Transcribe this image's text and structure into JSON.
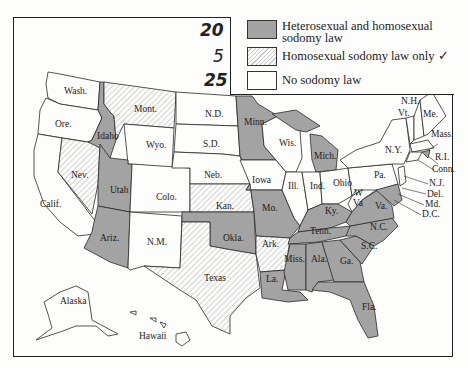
{
  "legend": {
    "items": [
      {
        "count": "20",
        "label_line1": "Heterosexual and homosexual",
        "label_line2": "sodomy law",
        "fill": "gray"
      },
      {
        "count": "5",
        "label_line1": "Homosexual sodomy law only ✓",
        "label_line2": "",
        "fill": "hatched"
      },
      {
        "count": "25",
        "label_line1": "No sodomy law",
        "label_line2": "",
        "fill": "white"
      }
    ]
  },
  "colors": {
    "gray": "#a3a3a3",
    "hatched": "#c8c8c8",
    "white": "#fdfdfb",
    "border": "#222222"
  },
  "states": {
    "gray": [
      "Idaho",
      "Utah",
      "Ariz.",
      "Minn.",
      "Mich.",
      "Mo.",
      "Okla.",
      "Ky.",
      "Tenn.",
      "Miss.",
      "Ala.",
      "Ga.",
      "S.C.",
      "N.C.",
      "Va.",
      "La.",
      "Fla.",
      "Md.",
      "R.I.",
      "D.C."
    ],
    "hatched": [
      "Mont.",
      "Nev.",
      "Kan.",
      "Ark.",
      "Texas"
    ],
    "white": [
      "Wash.",
      "Ore.",
      "Calif.",
      "Wyo.",
      "Colo.",
      "N.M.",
      "N.D.",
      "S.D.",
      "Neb.",
      "Iowa",
      "Wis.",
      "Ill.",
      "Ind.",
      "Ohio",
      "W Va.",
      "Pa.",
      "N.Y.",
      "Vt.",
      "N.H.",
      "Me.",
      "Mass.",
      "Conn.",
      "N.J.",
      "Del.",
      "Alaska",
      "Hawaii"
    ]
  },
  "labels": {
    "wash": "Wash.",
    "ore": "Ore.",
    "calif": "Calif.",
    "idaho": "Idaho",
    "nev": "Nev.",
    "mont": "Mont.",
    "wyo": "Wyo.",
    "utah": "Utah",
    "ariz": "Ariz.",
    "colo": "Colo.",
    "nm": "N.M.",
    "nd": "N.D.",
    "sd": "S.D.",
    "neb": "Neb.",
    "kan": "Kan.",
    "okla": "Okla.",
    "texas": "Texas",
    "minn": "Minn.",
    "iowa": "Iowa",
    "mo": "Mo.",
    "ark": "Ark.",
    "la": "La.",
    "wis": "Wis.",
    "ill": "Ill.",
    "mich": "Mich.",
    "ind": "Ind.",
    "ohio": "Ohio",
    "ky": "Ky.",
    "tenn": "Tenn.",
    "miss": "Miss.",
    "ala": "Ala.",
    "ga": "Ga.",
    "fla": "Fla.",
    "sc": "S.C.",
    "nc": "N.C.",
    "va": "Va.",
    "wva1": "W",
    "wva2": "Va",
    "pa": "Pa.",
    "ny": "N.Y.",
    "vt": "Vt.",
    "nh": "N.H.",
    "me": "Me.",
    "mass": "Mass.",
    "ri": "R.I.",
    "conn": "Conn.",
    "nj": "N.J.",
    "del": "Del.",
    "md": "Md.",
    "dc": "D.C.",
    "alaska": "Alaska",
    "hawaii": "Hawaii"
  }
}
